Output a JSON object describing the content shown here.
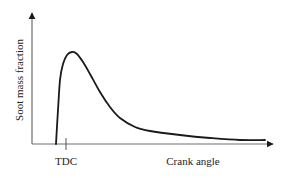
{
  "chart_data": {
    "type": "line",
    "title": "",
    "xlabel": "Crank angle",
    "ylabel": "Soot mass fraction",
    "x_tick_labels": [
      {
        "label": "TDC",
        "x_px": 66
      }
    ],
    "grid": false,
    "legend": null,
    "series": [
      {
        "name": "Soot mass fraction",
        "description": "Qualitative curve: soot forms sharply just before TDC, peaks shortly after TDC, then decays as soot is oxidized, leveling off to a small residual value",
        "points_px": [
          [
            56,
            144
          ],
          [
            58,
            110
          ],
          [
            60,
            80
          ],
          [
            63,
            64
          ],
          [
            67,
            55
          ],
          [
            72,
            52
          ],
          [
            77,
            54
          ],
          [
            83,
            62
          ],
          [
            90,
            74
          ],
          [
            100,
            92
          ],
          [
            110,
            107
          ],
          [
            120,
            118
          ],
          [
            135,
            127
          ],
          [
            150,
            131
          ],
          [
            180,
            135
          ],
          [
            210,
            138
          ],
          [
            240,
            140
          ],
          [
            265,
            140
          ]
        ]
      }
    ],
    "axes": {
      "origin_px": [
        32,
        144
      ],
      "y_axis_top_px": [
        32,
        12
      ],
      "x_axis_end_px": [
        274,
        144
      ],
      "arrows": true
    }
  },
  "colors": {
    "line": "#1a1a1a",
    "axis": "#6e6e6e",
    "text": "#222222",
    "background": "#ffffff"
  }
}
